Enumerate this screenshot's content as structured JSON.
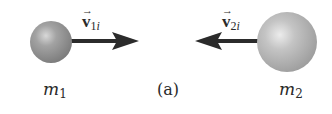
{
  "figure": {
    "caption": "(a)",
    "colors": {
      "background": "#ffffff",
      "arrow": "#2b2b2b",
      "sphere_light": "#d6d6d6",
      "sphere_dark": "#7d7d7d",
      "text": "#2a2a2a"
    },
    "objects": [
      {
        "id": "m1",
        "mass_symbol": "m",
        "mass_subscript": "1",
        "velocity_symbol": "v",
        "velocity_subscript_num": "1",
        "velocity_subscript_var": "i",
        "direction": "right",
        "size": "small"
      },
      {
        "id": "m2",
        "mass_symbol": "m",
        "mass_subscript": "2",
        "velocity_symbol": "v",
        "velocity_subscript_num": "2",
        "velocity_subscript_var": "i",
        "direction": "left",
        "size": "large"
      }
    ],
    "vector_arrow_glyph": "→"
  }
}
